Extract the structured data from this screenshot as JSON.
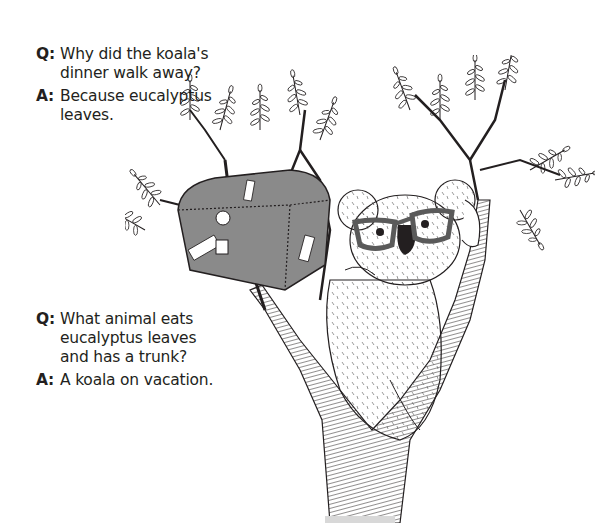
{
  "jokes": [
    {
      "q_label": "Q:",
      "question": "Why did the koala's\ndinner walk away?",
      "a_label": "A:",
      "answer": "Because eucalyptus\nleaves."
    },
    {
      "q_label": "Q:",
      "question": "What animal eats\neucalyptus leaves\nand has a trunk?",
      "a_label": "A:",
      "answer": "A koala on vacation."
    }
  ],
  "illustration": {
    "subject": "koala wearing glasses in a eucalyptus tree with a luggage trunk",
    "style": "black-and-white pen-and-ink",
    "colors": {
      "ink": "#231f20",
      "trunk_fill": "#8a8a8a",
      "glasses": "#5a5a5a",
      "paper": "#ffffff"
    }
  }
}
